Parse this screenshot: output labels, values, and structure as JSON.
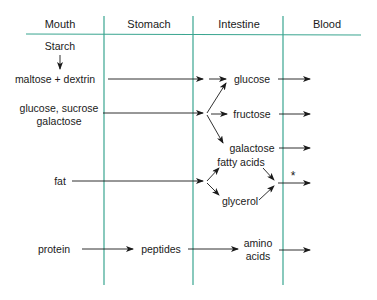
{
  "colors": {
    "grid_line": "#3aa590",
    "arrow": "#1a1a1a",
    "text": "#1a1a1a"
  },
  "columns": [
    {
      "label": "Mouth"
    },
    {
      "label": "Stomach"
    },
    {
      "label": "Intestine"
    },
    {
      "label": "Blood"
    }
  ],
  "mouth": {
    "starch": "Starch",
    "maltose_dextrin": "maltose + dextrin",
    "sugars_line1": "glucose, sucrose",
    "sugars_line2": "galactose",
    "fat": "fat",
    "protein": "protein"
  },
  "stomach": {
    "peptides": "peptides"
  },
  "intestine": {
    "glucose": "glucose",
    "fructose": "fructose",
    "galactose": "galactose",
    "fatty_acids": "fatty acids",
    "glycerol": "glycerol",
    "amino_line1": "amino",
    "amino_line2": "acids"
  },
  "blood": {
    "asterisk": "*"
  }
}
